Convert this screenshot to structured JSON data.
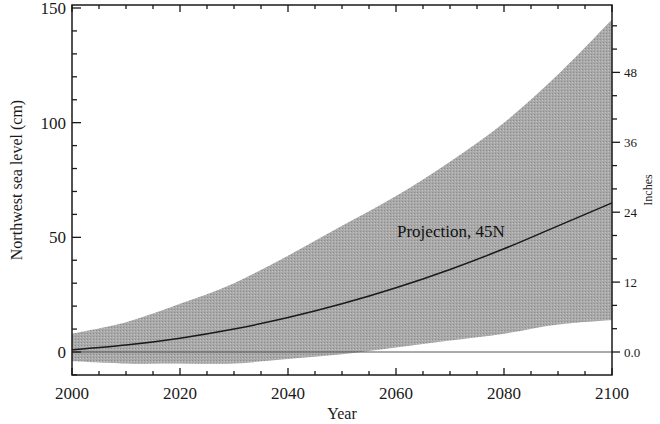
{
  "chart_data": {
    "type": "area",
    "title": "",
    "xlabel": "Year",
    "ylabel": "Northwest sea level (cm)",
    "y2label": "Inches",
    "xlim": [
      2000,
      2100
    ],
    "ylim": [
      -10,
      150
    ],
    "x_ticks": [
      2000,
      2020,
      2040,
      2060,
      2080,
      2100
    ],
    "x_tick_labels": [
      "2000",
      "2020",
      "2040",
      "2060",
      "2080",
      "2100"
    ],
    "y_ticks": [
      0,
      50,
      100,
      150
    ],
    "y_tick_labels": [
      "0",
      "50",
      "100",
      "150"
    ],
    "y2_ticks": [
      0,
      12,
      24,
      36,
      48
    ],
    "y2_tick_labels": [
      "0.0",
      "12",
      "24",
      "36",
      "48"
    ],
    "grid": false,
    "legend": null,
    "annotations": [
      {
        "text": "Projection, 45N",
        "x": 2070,
        "y": 52
      }
    ],
    "x": [
      2000,
      2010,
      2020,
      2030,
      2040,
      2050,
      2060,
      2070,
      2080,
      2090,
      2100
    ],
    "series": [
      {
        "name": "Upper bound",
        "values": [
          8,
          13,
          21,
          30,
          42,
          55,
          68,
          83,
          100,
          121,
          145
        ]
      },
      {
        "name": "Projection (mean)",
        "values": [
          1,
          3,
          6,
          10,
          15,
          21,
          28,
          36,
          45,
          55,
          65
        ]
      },
      {
        "name": "Lower bound",
        "values": [
          -4,
          -5,
          -5,
          -5,
          -3,
          -1,
          2,
          5,
          8,
          12,
          14
        ]
      }
    ],
    "reference_line": {
      "y": 0,
      "label": "0.0"
    }
  }
}
